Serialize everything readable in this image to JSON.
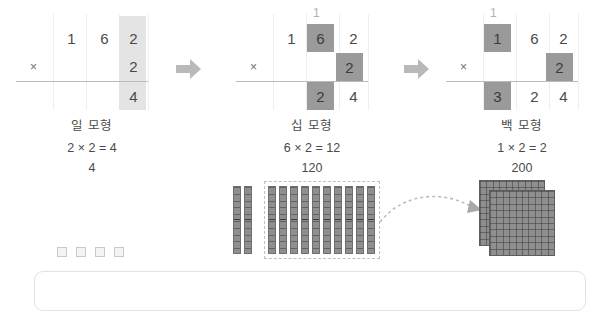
{
  "steps": [
    {
      "id": "ones",
      "carry": "",
      "row1": [
        "",
        "1",
        "6",
        "2"
      ],
      "row2_operator": "×",
      "row2": [
        "",
        "",
        "",
        "2"
      ],
      "row3": [
        "",
        "",
        "",
        "4"
      ],
      "caption_title": "일 모형",
      "caption_equation": "2 × 2 = 4",
      "caption_value": "4",
      "highlight_color": "#e4e4e4"
    },
    {
      "id": "tens",
      "carry": "1",
      "row1": [
        "",
        "1",
        "6",
        "2"
      ],
      "row2_operator": "×",
      "row2": [
        "",
        "",
        "",
        "2"
      ],
      "row3": [
        "",
        "",
        "2",
        "4"
      ],
      "caption_title": "십 모형",
      "caption_equation": "6 × 2 = 12",
      "caption_value": "120",
      "highlight_color": "#9a9a9a"
    },
    {
      "id": "hundreds",
      "carry": "1",
      "row1": [
        "",
        "1",
        "6",
        "2"
      ],
      "row2_operator": "×",
      "row2": [
        "",
        "",
        "",
        "2"
      ],
      "row3": [
        "",
        "3",
        "2",
        "4"
      ],
      "caption_title": "백 모형",
      "caption_equation": "1 × 2 = 2",
      "caption_value": "200",
      "highlight_color": "#9a9a9a"
    }
  ],
  "arrows": {
    "step_arrow_1": "arrow-right",
    "step_arrow_2": "arrow-right",
    "regroup_arrow": "curved-dashed-arrow-right"
  },
  "manipulatives": {
    "unit_cubes_count": 4,
    "loose_rods_count": 2,
    "grouped_rods_count": 10,
    "flats_count": 2,
    "grouping_box_label": "dashed-grouping-box"
  }
}
